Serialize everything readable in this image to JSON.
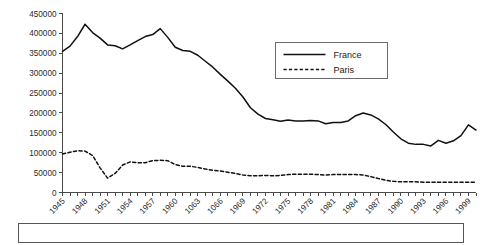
{
  "chart_data": {
    "type": "line",
    "title": "",
    "subtitle": "",
    "xlabel": "",
    "ylabel": "",
    "xlim": [
      1945,
      2000
    ],
    "ylim": [
      0,
      450000
    ],
    "grid": false,
    "legend_position": "top-right",
    "y_ticks": [
      0,
      50000,
      100000,
      150000,
      200000,
      250000,
      300000,
      350000,
      400000,
      450000
    ],
    "y_tick_labels": [
      "0",
      "50000",
      "100000",
      "150000",
      "200000",
      "250000",
      "300000",
      "350000",
      "400000",
      "450000"
    ],
    "x_tick_labels": [
      "1945",
      "1948",
      "1951",
      "1954",
      "1957",
      "1960",
      "1063",
      "1066",
      "1969",
      "1972",
      "1975",
      "1978",
      "1981",
      "1984",
      "1987",
      "1990",
      "1993",
      "1996",
      "1999"
    ],
    "x_tick_years": [
      1945,
      1948,
      1951,
      1954,
      1957,
      1960,
      1963,
      1966,
      1969,
      1972,
      1975,
      1978,
      1981,
      1984,
      1987,
      1990,
      1993,
      1996,
      1999
    ],
    "x": [
      1945,
      1946,
      1947,
      1948,
      1949,
      1950,
      1951,
      1952,
      1953,
      1954,
      1955,
      1956,
      1957,
      1958,
      1959,
      1960,
      1961,
      1962,
      1963,
      1964,
      1965,
      1966,
      1967,
      1968,
      1969,
      1970,
      1971,
      1972,
      1973,
      1974,
      1975,
      1976,
      1977,
      1978,
      1979,
      1980,
      1981,
      1982,
      1983,
      1984,
      1985,
      1986,
      1987,
      1988,
      1989,
      1990,
      1991,
      1992,
      1993,
      1994,
      1995,
      1996,
      1997,
      1998,
      1999,
      2000
    ],
    "series": [
      {
        "name": "France",
        "style": "solid",
        "color": "#111111",
        "values": [
          355000,
          368000,
          392000,
          423000,
          402000,
          388000,
          371000,
          369000,
          361000,
          371000,
          382000,
          392000,
          397000,
          412000,
          390000,
          365000,
          357000,
          355000,
          345000,
          330000,
          315000,
          297000,
          280000,
          262000,
          240000,
          213000,
          197000,
          186000,
          183000,
          179000,
          182000,
          180000,
          180000,
          181000,
          180000,
          173000,
          176000,
          176000,
          180000,
          193000,
          200000,
          195000,
          185000,
          171000,
          152000,
          135000,
          124000,
          121000,
          121000,
          117000,
          131000,
          124000,
          130000,
          143000,
          170000,
          157000
        ]
      },
      {
        "name": "Paris",
        "style": "dashed",
        "color": "#111111",
        "values": [
          97000,
          101000,
          105000,
          104000,
          93000,
          62000,
          36000,
          48000,
          69000,
          77000,
          75000,
          75000,
          80000,
          81000,
          80000,
          70000,
          66000,
          66000,
          63000,
          59000,
          56000,
          54000,
          51000,
          48000,
          44000,
          42000,
          42000,
          43000,
          42000,
          43000,
          45000,
          46000,
          46000,
          46000,
          45000,
          44000,
          45000,
          45000,
          45000,
          45000,
          44000,
          40000,
          35000,
          31000,
          28000,
          27000,
          27000,
          27000,
          26000,
          26000,
          26000,
          26000,
          26000,
          26000,
          26000,
          26000
        ]
      }
    ]
  },
  "legend": {
    "items": [
      {
        "label": "France",
        "style": "solid"
      },
      {
        "label": "Paris",
        "style": "dashed"
      }
    ]
  },
  "caption": {
    "text": ""
  }
}
